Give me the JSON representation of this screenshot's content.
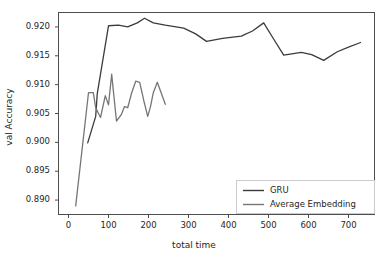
{
  "chart_data": {
    "type": "line",
    "title": "",
    "xlabel": "total time",
    "ylabel": "val Accuracy",
    "xlim": [
      -25,
      765
    ],
    "ylim": [
      0.8875,
      0.9225
    ],
    "xticks": [
      0,
      100,
      200,
      300,
      400,
      500,
      600,
      700
    ],
    "xticklabels": [
      "0",
      "100",
      "200",
      "300",
      "400",
      "500",
      "600",
      "700"
    ],
    "yticks": [
      0.89,
      0.895,
      0.9,
      0.905,
      0.91,
      0.915,
      0.92
    ],
    "yticklabels": [
      "0.890",
      "0.895",
      "0.900",
      "0.905",
      "0.910",
      "0.915",
      "0.920"
    ],
    "grid": false,
    "legend_position": "lower right",
    "series": [
      {
        "name": "GRU",
        "color": "#3b3b3b",
        "x": [
          48,
          68,
          72,
          100,
          125,
          148,
          172,
          190,
          212,
          242,
          288,
          318,
          345,
          385,
          432,
          460,
          488,
          512,
          538,
          582,
          608,
          638,
          672,
          700,
          730
        ],
        "y": [
          0.8999,
          0.9045,
          0.9085,
          0.9202,
          0.9203,
          0.92,
          0.9207,
          0.9215,
          0.9207,
          0.9203,
          0.9198,
          0.9188,
          0.9175,
          0.918,
          0.9184,
          0.9193,
          0.9207,
          0.918,
          0.9151,
          0.9156,
          0.9152,
          0.9142,
          0.9157,
          0.9165,
          0.9173
        ]
      },
      {
        "name": "Average Embedding",
        "color": "#767676",
        "x": [
          18,
          50,
          62,
          68,
          80,
          92,
          100,
          108,
          112,
          120,
          132,
          140,
          148,
          158,
          168,
          178,
          188,
          198,
          205,
          212,
          222,
          232,
          242
        ],
        "y": [
          0.889,
          0.9086,
          0.9086,
          0.906,
          0.9043,
          0.9081,
          0.9065,
          0.9118,
          0.909,
          0.9037,
          0.9048,
          0.9062,
          0.906,
          0.9086,
          0.9106,
          0.9104,
          0.9073,
          0.9045,
          0.9062,
          0.9086,
          0.9104,
          0.9085,
          0.9066
        ]
      }
    ]
  },
  "legend": {
    "entries": [
      {
        "label": "GRU",
        "color": "#3b3b3b"
      },
      {
        "label": "Average Embedding",
        "color": "#767676"
      }
    ]
  },
  "axes": {
    "spine_color": "#4d4d4d",
    "text_color": "#262626"
  }
}
